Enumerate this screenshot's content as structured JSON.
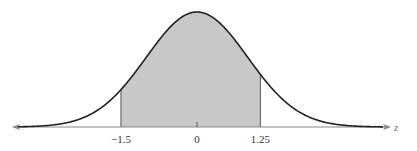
{
  "chart_data": {
    "type": "area",
    "title": "",
    "subtitle": "",
    "xlabel": "z",
    "ylabel": "",
    "distribution": {
      "name": "standard normal",
      "mean": 0,
      "sd": 1
    },
    "shaded_region": {
      "from": -1.5,
      "to": 1.25
    },
    "tick_labels": [
      "−1.5",
      "0",
      "1.25"
    ],
    "ticks": [
      -1.5,
      0,
      1.25
    ],
    "xlim": [
      -3.7,
      3.8
    ],
    "grid": false,
    "legend": null,
    "colors": {
      "curve": "#222222",
      "fill": "#c8c8c8",
      "axis": "#888888"
    }
  }
}
